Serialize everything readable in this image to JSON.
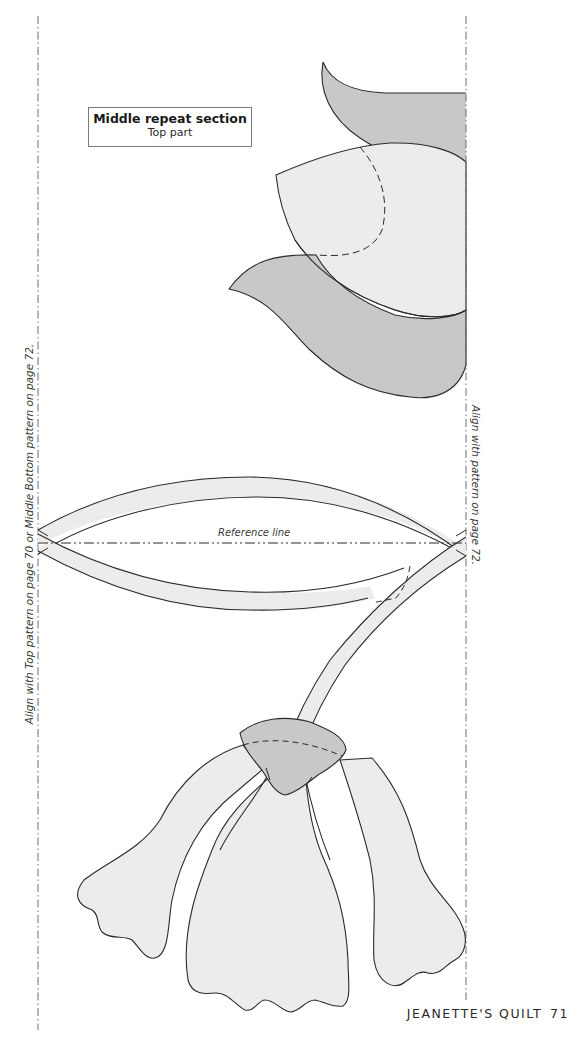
{
  "page": {
    "footer": {
      "book_title": "JEANETTE'S QUILT",
      "page_number": "71"
    }
  },
  "label": {
    "title": "Middle repeat section",
    "subtitle": "Top part"
  },
  "guides": {
    "left_text": "Align with Top pattern on page 70 or Middle Bottom pattern on page 72.",
    "right_text": "Align with pattern on page 72.",
    "reference_line_label": "Reference line"
  },
  "colors": {
    "dark_fill": "#c8c8c8",
    "light_fill": "#ececec",
    "stroke": "#2b2b2b",
    "guide_line": "#6e6e6e"
  }
}
